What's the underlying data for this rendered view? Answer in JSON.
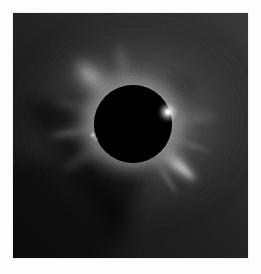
{
  "image": {
    "subject": "total-solar-eclipse",
    "description": "Total solar eclipse corona photograph",
    "frame": {
      "x": 13,
      "y": 13,
      "width": 235,
      "height": 245,
      "border_color": "#ffffff",
      "page_background": "#ffffff"
    }
  },
  "scene": {
    "occulting_disk": {
      "name": "lunar-disk",
      "center_x": 120,
      "center_y": 111,
      "radius": 39,
      "color": "#000000"
    },
    "sky": {
      "base_color": "#1d1d1d",
      "darkest_color": "#141414",
      "brightest_color": "#f2f2f2"
    },
    "corona": {
      "type": "K-corona streamers",
      "inner_glow_color": "#e8e8e8",
      "mid_glow_color": "#8a8a8a",
      "outer_glow_color": "#2a2a2a"
    }
  },
  "chart_data": {
    "type": "heatmap",
    "xlabel": "",
    "ylabel": "",
    "x": [
      0,
      235
    ],
    "y": [
      0,
      245
    ],
    "grid": false,
    "legend": "none",
    "annotations": [
      "Black occulting lunar disk at image centre",
      "Bright helmet streamer toward upper-left",
      "Broad streamer fan toward lower-right / bottom",
      "Equatorial streamers east and west of the disk",
      "Dark coronal-hole region in lower-left quadrant",
      "Chromospheric bright point on west (right) limb",
      "Small prominence bead on east (left) limb"
    ],
    "features": [
      {
        "name": "streamer-upper-left",
        "angle_deg": 138,
        "length": 150,
        "peak_brightness": 0.72,
        "width_deg": 26
      },
      {
        "name": "streamer-upper-right",
        "angle_deg": 34,
        "length": 120,
        "peak_brightness": 0.7,
        "width_deg": 20
      },
      {
        "name": "streamer-right-equatorial",
        "angle_deg": 8,
        "length": 120,
        "peak_brightness": 0.82,
        "width_deg": 16
      },
      {
        "name": "streamer-lower-right",
        "angle_deg": -48,
        "length": 150,
        "peak_brightness": 0.78,
        "width_deg": 30
      },
      {
        "name": "streamer-bottom",
        "angle_deg": -80,
        "length": 120,
        "peak_brightness": 0.55,
        "width_deg": 18
      },
      {
        "name": "streamer-left-equatorial",
        "angle_deg": 186,
        "length": 110,
        "peak_brightness": 0.58,
        "width_deg": 14
      },
      {
        "name": "coronal-hole-lower-left",
        "angle_deg": 216,
        "length": 140,
        "peak_brightness": 0.1,
        "width_deg": 50
      }
    ],
    "limb_points": [
      {
        "name": "bright-limb-point-west",
        "x": 155,
        "y": 99,
        "brightness": 1.0
      },
      {
        "name": "prominence-bead-east",
        "x": 80,
        "y": 122,
        "brightness": 0.9
      }
    ]
  }
}
